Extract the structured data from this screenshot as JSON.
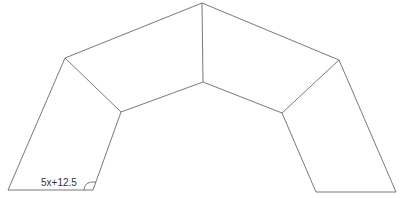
{
  "diagram": {
    "type": "geometry-figure",
    "angle_label": "5x+12.5",
    "stroke_color": "#6a6a6a",
    "vertices": {
      "top_outer": [
        202,
        3
      ],
      "top_inner": [
        203,
        82
      ],
      "left_outer": [
        65,
        58
      ],
      "left_inner": [
        121,
        112
      ],
      "right_outer": [
        339,
        60
      ],
      "right_inner": [
        282,
        113
      ],
      "left_bottom_outer": [
        8,
        190
      ],
      "left_bottom_inner": [
        93,
        190
      ],
      "right_bottom_inner": [
        316,
        192
      ],
      "right_bottom_outer": [
        396,
        192
      ]
    }
  }
}
